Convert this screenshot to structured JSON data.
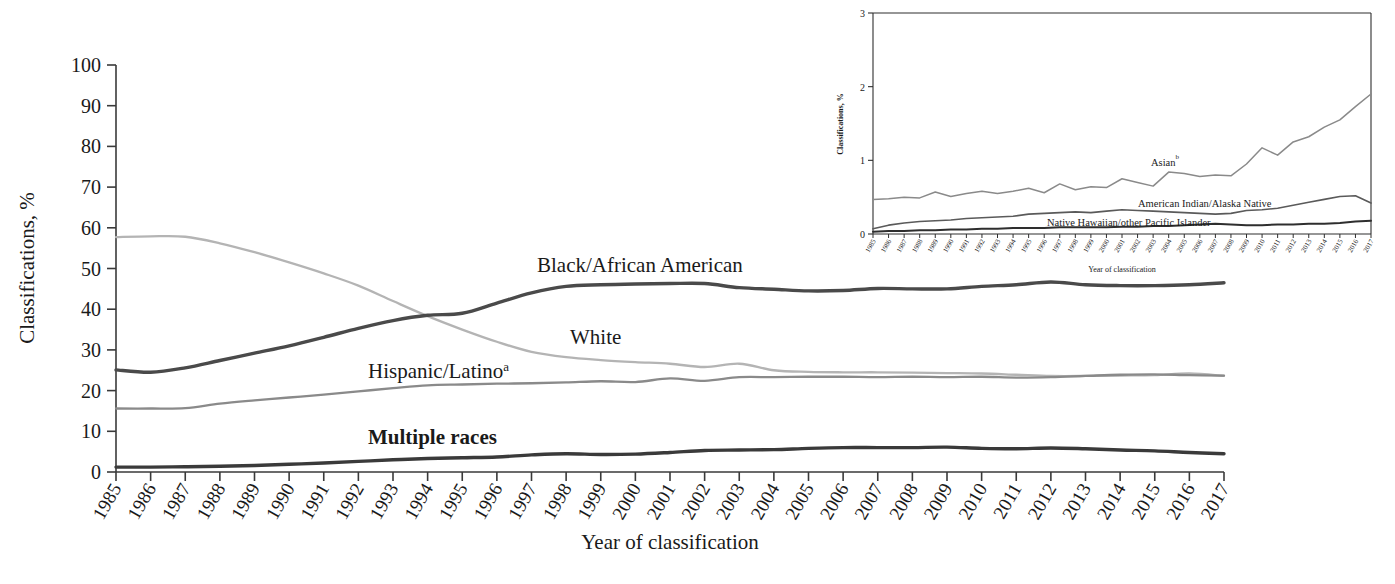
{
  "figure": {
    "title": "",
    "caption_partial": "",
    "background": "#ffffff"
  },
  "main_chart": {
    "ylabel": "Classifications, %",
    "xlabel": "Year of classification",
    "y_ticks": [
      "0",
      "10",
      "20",
      "30",
      "40",
      "50",
      "60",
      "70",
      "80",
      "90",
      "100"
    ],
    "series_labels": {
      "black": "Black/African American",
      "white": "White",
      "hispanic": "Hispanic/Latino",
      "hispanic_sup": "a",
      "multiple": "Multiple races"
    },
    "colors": {
      "black": "#4a4a4a",
      "white": "#b4b4b4",
      "hispanic": "#8a8a8a",
      "multiple": "#3a3a3a",
      "axis": "#3a3a3a"
    }
  },
  "inset_chart": {
    "ylabel": "Classifications, %",
    "xlabel": "Year of classification",
    "y_ticks": [
      "0",
      "1",
      "2",
      "3"
    ],
    "series_labels": {
      "asian": "Asian",
      "asian_sup": "b",
      "aian": "American Indian/Alaska Native",
      "nhopi": "Native Hawaiian/other Pacific Islander"
    },
    "colors": {
      "asian": "#8a8a8a",
      "aian": "#5a5a5a",
      "nhopi": "#2e2e2e",
      "axis": "#2e2e2e"
    }
  },
  "chart_data": [
    {
      "type": "line",
      "id": "main",
      "title": "",
      "xlabel": "Year of classification",
      "ylabel": "Classifications, %",
      "xlim": [
        1985,
        2017
      ],
      "ylim": [
        0,
        100
      ],
      "yticks": [
        0,
        10,
        20,
        30,
        40,
        50,
        60,
        70,
        80,
        90,
        100
      ],
      "grid": false,
      "legend": "inline-labels",
      "x": [
        1985,
        1986,
        1987,
        1988,
        1989,
        1990,
        1991,
        1992,
        1993,
        1994,
        1995,
        1996,
        1997,
        1998,
        1999,
        2000,
        2001,
        2002,
        2003,
        2004,
        2005,
        2006,
        2007,
        2008,
        2009,
        2010,
        2011,
        2012,
        2013,
        2014,
        2015,
        2016,
        2017
      ],
      "series": [
        {
          "name": "White",
          "color": "#b4b4b4",
          "values": [
            57.7,
            57.9,
            57.8,
            56.2,
            54.0,
            51.5,
            48.8,
            45.8,
            42.0,
            38.3,
            35.0,
            32.0,
            29.5,
            28.2,
            27.5,
            27.0,
            26.6,
            25.8,
            26.6,
            25.0,
            24.6,
            24.5,
            24.5,
            24.4,
            24.3,
            24.2,
            23.9,
            23.6,
            23.6,
            23.7,
            23.8,
            24.2,
            23.6
          ]
        },
        {
          "name": "Black/African American",
          "color": "#4a4a4a",
          "values": [
            25.1,
            24.5,
            25.6,
            27.4,
            29.2,
            31.0,
            33.1,
            35.3,
            37.2,
            38.5,
            39.0,
            41.5,
            44.0,
            45.6,
            46.0,
            46.2,
            46.3,
            46.3,
            45.3,
            44.9,
            44.5,
            44.6,
            45.1,
            45.0,
            45.0,
            45.6,
            46.0,
            46.7,
            46.0,
            45.8,
            45.8,
            46.0,
            46.5
          ]
        },
        {
          "name": "Hispanic/Latino",
          "color": "#8a8a8a",
          "values": [
            15.6,
            15.6,
            15.7,
            16.8,
            17.6,
            18.3,
            19.0,
            19.8,
            20.6,
            21.3,
            21.5,
            21.7,
            21.8,
            22.0,
            22.3,
            22.1,
            23.0,
            22.4,
            23.3,
            23.3,
            23.4,
            23.4,
            23.3,
            23.4,
            23.3,
            23.4,
            23.2,
            23.3,
            23.6,
            23.9,
            24.0,
            23.8,
            23.7
          ]
        },
        {
          "name": "Multiple races",
          "color": "#3a3a3a",
          "values": [
            1.2,
            1.2,
            1.3,
            1.4,
            1.6,
            1.9,
            2.2,
            2.6,
            3.0,
            3.3,
            3.5,
            3.7,
            4.2,
            4.5,
            4.3,
            4.4,
            4.8,
            5.3,
            5.4,
            5.5,
            5.8,
            6.0,
            6.0,
            6.0,
            6.1,
            5.8,
            5.7,
            5.9,
            5.7,
            5.4,
            5.2,
            4.8,
            4.5
          ]
        }
      ]
    },
    {
      "type": "line",
      "id": "inset",
      "title": "",
      "xlabel": "Year of classification",
      "ylabel": "Classifications, %",
      "xlim": [
        1985,
        2017
      ],
      "ylim": [
        0,
        3
      ],
      "yticks": [
        0,
        1,
        2,
        3
      ],
      "grid": false,
      "legend": "inline-labels",
      "x": [
        1985,
        1986,
        1987,
        1988,
        1989,
        1990,
        1991,
        1992,
        1993,
        1994,
        1995,
        1996,
        1997,
        1998,
        1999,
        2000,
        2001,
        2002,
        2003,
        2004,
        2005,
        2006,
        2007,
        2008,
        2009,
        2010,
        2011,
        2012,
        2013,
        2014,
        2015,
        2016,
        2017
      ],
      "series": [
        {
          "name": "Asian",
          "color": "#8a8a8a",
          "values": [
            0.47,
            0.48,
            0.5,
            0.49,
            0.57,
            0.51,
            0.55,
            0.58,
            0.55,
            0.58,
            0.62,
            0.56,
            0.68,
            0.6,
            0.64,
            0.63,
            0.75,
            0.7,
            0.65,
            0.84,
            0.82,
            0.78,
            0.8,
            0.79,
            0.95,
            1.17,
            1.07,
            1.25,
            1.32,
            1.45,
            1.55,
            1.73,
            1.9
          ]
        },
        {
          "name": "American Indian/Alaska Native",
          "color": "#5a5a5a",
          "values": [
            0.07,
            0.12,
            0.15,
            0.17,
            0.18,
            0.19,
            0.21,
            0.22,
            0.23,
            0.24,
            0.27,
            0.28,
            0.29,
            0.3,
            0.29,
            0.31,
            0.33,
            0.32,
            0.31,
            0.3,
            0.29,
            0.28,
            0.27,
            0.28,
            0.32,
            0.33,
            0.35,
            0.39,
            0.43,
            0.47,
            0.51,
            0.52,
            0.42
          ]
        },
        {
          "name": "Native Hawaiian/other Pacific Islander",
          "color": "#2e2e2e",
          "values": [
            0.03,
            0.04,
            0.04,
            0.05,
            0.05,
            0.06,
            0.06,
            0.07,
            0.07,
            0.08,
            0.08,
            0.08,
            0.09,
            0.09,
            0.09,
            0.09,
            0.1,
            0.1,
            0.11,
            0.11,
            0.12,
            0.13,
            0.14,
            0.13,
            0.12,
            0.12,
            0.13,
            0.13,
            0.14,
            0.14,
            0.15,
            0.17,
            0.18
          ]
        }
      ]
    }
  ]
}
